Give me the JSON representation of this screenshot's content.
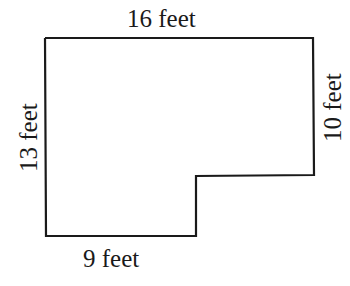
{
  "diagram": {
    "type": "L-shaped floor plan outline",
    "labels": {
      "top": "16 feet",
      "left": "13 feet",
      "right": "10 feet",
      "bottom": "9 feet"
    },
    "colors": {
      "stroke": "#1a1a1a",
      "background": "#ffffff"
    }
  }
}
